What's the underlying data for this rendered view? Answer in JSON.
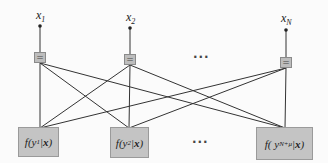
{
  "diagram": {
    "type": "factor-graph",
    "variables": [
      {
        "id": "x1",
        "base": "x",
        "sub": "1"
      },
      {
        "id": "x2",
        "base": "x",
        "sub": "2"
      },
      {
        "id": "xN",
        "base": "x",
        "sub": "N"
      }
    ],
    "equality_nodes": [
      {
        "id": "eq1",
        "symbol": "="
      },
      {
        "id": "eq2",
        "symbol": "="
      },
      {
        "id": "eqN",
        "symbol": "="
      }
    ],
    "functions": [
      {
        "id": "f1",
        "prefix": "f(y",
        "sub": "1",
        "mid": "|",
        "bold": "x",
        "suffix": ")"
      },
      {
        "id": "f2",
        "prefix": "f(y",
        "sub": "2",
        "mid": "|",
        "bold": "x",
        "suffix": ")"
      },
      {
        "id": "fN",
        "prefix": "f( y",
        "sub": "N+μ",
        "mid": " | ",
        "bold": "x",
        "suffix": ")"
      }
    ],
    "ellipsis_top": "···",
    "ellipsis_bottom": "···",
    "edges": [
      [
        "eq1",
        "f1"
      ],
      [
        "eq1",
        "f2"
      ],
      [
        "eq1",
        "fN"
      ],
      [
        "eq2",
        "f1"
      ],
      [
        "eq2",
        "f2"
      ],
      [
        "eq2",
        "fN"
      ],
      [
        "eqN",
        "f1"
      ],
      [
        "eqN",
        "f2"
      ],
      [
        "eqN",
        "fN"
      ]
    ],
    "colors": {
      "node_fill": "#bdbdbd",
      "node_border": "#8a8a8a",
      "function_fill": "#c4c4c4",
      "edge": "#333333"
    }
  }
}
